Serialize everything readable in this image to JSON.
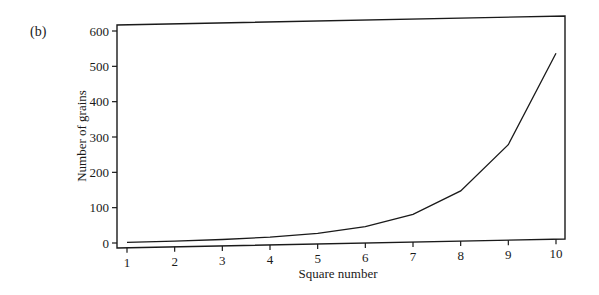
{
  "panel_label": "(b)",
  "chart_data": {
    "type": "line",
    "title": "",
    "xlabel": "Square number",
    "ylabel": "Number of grains",
    "x": [
      1,
      2,
      3,
      4,
      5,
      6,
      7,
      8,
      9,
      10
    ],
    "series": [
      {
        "name": "Number of grains",
        "values": [
          1,
          2,
          4,
          8,
          16,
          32,
          64,
          128,
          256,
          512
        ]
      }
    ],
    "xlim": [
      1,
      10
    ],
    "ylim": [
      0,
      600
    ],
    "xticks": [
      1,
      2,
      3,
      4,
      5,
      6,
      7,
      8,
      9,
      10
    ],
    "yticks": [
      0,
      100,
      200,
      300,
      400,
      500,
      600
    ],
    "grid": false,
    "legend": "none",
    "colors": {
      "line": "#1a1a1a",
      "axes": "#1a1a1a"
    }
  }
}
